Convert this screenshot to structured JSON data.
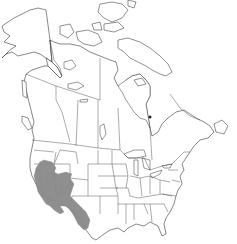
{
  "map": {
    "type": "species-range-map",
    "region": "North America",
    "countries_shown": [
      "Canada",
      "United States",
      "Alaska (US)",
      "Greenland (partial)"
    ],
    "shaded_range": {
      "description": "Distribution range in southwestern United States",
      "areas": [
        "California",
        "Nevada",
        "Utah",
        "Arizona",
        "New Mexico (western edge)",
        "Idaho (southern edge)"
      ],
      "fill_color": "#8a8a8a"
    },
    "colors": {
      "background": "#ffffff",
      "outline": "#222222",
      "range_fill": "#8a8a8a"
    }
  }
}
